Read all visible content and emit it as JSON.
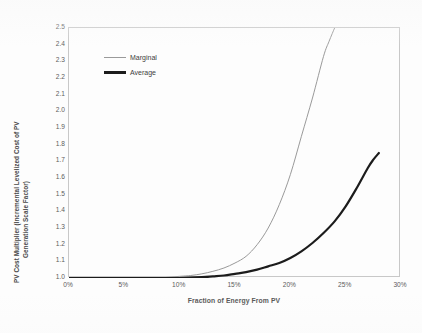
{
  "chart_data": {
    "type": "line",
    "title": "",
    "xlabel": "Fraction of Energy From PV",
    "ylabel": "PV Cost Multiplier (Incremental Levelized Cost of PV Generation Scale Factor)",
    "ylabel_line1": "PV Cost Multiplier (Incremental Levelized Cost of PV",
    "ylabel_line2": "Generation Scale Factor)",
    "xlim": [
      0,
      30
    ],
    "ylim": [
      1.0,
      2.5
    ],
    "grid": false,
    "legend_position": "upper-left-inside",
    "xticks": [
      "0%",
      "5%",
      "10%",
      "15%",
      "20%",
      "25%",
      "30%"
    ],
    "xtick_values": [
      0,
      5,
      10,
      15,
      20,
      25,
      30
    ],
    "yticks": [
      "1.0",
      "1.1",
      "1.2",
      "1.3",
      "1.4",
      "1.5",
      "1.6",
      "1.7",
      "1.8",
      "1.9",
      "2.0",
      "2.1",
      "2.2",
      "2.3",
      "2.4",
      "2.5"
    ],
    "ytick_values": [
      1.0,
      1.1,
      1.2,
      1.3,
      1.4,
      1.5,
      1.6,
      1.7,
      1.8,
      1.9,
      2.0,
      2.1,
      2.2,
      2.3,
      2.4,
      2.5
    ],
    "series": [
      {
        "name": "Marginal",
        "color": "#9a9a9a",
        "width": 1.0,
        "x": [
          0,
          2,
          4,
          6,
          8,
          10,
          11,
          12,
          13,
          14,
          15,
          16,
          17,
          18,
          19,
          20,
          21,
          22,
          23,
          23.5,
          24
        ],
        "values": [
          1.0,
          1.0,
          1.0,
          1.0,
          1.0,
          1.01,
          1.015,
          1.025,
          1.04,
          1.06,
          1.09,
          1.13,
          1.2,
          1.3,
          1.44,
          1.62,
          1.85,
          2.08,
          2.33,
          2.42,
          2.5
        ]
      },
      {
        "name": "Average",
        "color": "#1c1c1c",
        "width": 2.2,
        "x": [
          0,
          2,
          4,
          6,
          8,
          10,
          12,
          13,
          14,
          15,
          16,
          17,
          18,
          19,
          20,
          21,
          22,
          23,
          24,
          25,
          26,
          27,
          27.5,
          28
        ],
        "values": [
          1.0,
          1.0,
          1.0,
          1.0,
          1.0,
          1.0,
          1.005,
          1.01,
          1.015,
          1.025,
          1.035,
          1.05,
          1.07,
          1.09,
          1.12,
          1.16,
          1.21,
          1.27,
          1.34,
          1.43,
          1.54,
          1.66,
          1.71,
          1.75
        ]
      }
    ],
    "legend": [
      {
        "label": "Marginal"
      },
      {
        "label": "Average"
      }
    ]
  }
}
